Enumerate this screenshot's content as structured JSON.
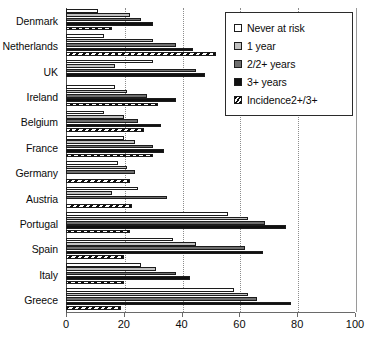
{
  "chart_data": {
    "type": "bar",
    "orientation": "horizontal",
    "title": "",
    "xlabel": "",
    "ylabel": "",
    "xlim": [
      0,
      100
    ],
    "xticks": [
      0,
      20,
      40,
      60,
      80,
      100
    ],
    "grid": true,
    "legend_position": "top-right",
    "categories": [
      "Denmark",
      "Netherlands",
      "UK",
      "Ireland",
      "Belgium",
      "France",
      "Germany",
      "Austria",
      "Portugal",
      "Spain",
      "Italy",
      "Greece"
    ],
    "series": [
      {
        "name": "Never at risk",
        "color": "#ffffff",
        "values": [
          11,
          13,
          30,
          17,
          13,
          20,
          18,
          25,
          56,
          37,
          26,
          58
        ]
      },
      {
        "name": "1 year",
        "color": "#c0c0c0",
        "values": [
          22,
          30,
          17,
          21,
          20,
          24,
          21,
          16,
          63,
          45,
          31,
          63
        ]
      },
      {
        "name": "2/2+ years",
        "color": "#6e6e6e",
        "values": [
          26,
          38,
          45,
          28,
          25,
          30,
          24,
          35,
          69,
          62,
          38,
          66
        ]
      },
      {
        "name": "3+ years",
        "color": "#101010",
        "values": [
          30,
          44,
          48,
          38,
          33,
          34,
          0,
          0,
          76,
          68,
          43,
          78
        ]
      },
      {
        "name": "Incidence2+/3+",
        "color": "#hatch",
        "values": [
          16,
          52,
          0,
          32,
          27,
          30,
          22,
          23,
          22,
          20,
          20,
          19
        ]
      }
    ]
  },
  "legend": {
    "items": [
      {
        "label": "Never at risk"
      },
      {
        "label": "1 year"
      },
      {
        "label": "2/2+ years"
      },
      {
        "label": "3+ years"
      },
      {
        "label": "Incidence2+/3+"
      }
    ]
  },
  "axis": {
    "x_tick_labels": [
      "0",
      "20",
      "40",
      "60",
      "80",
      "100"
    ]
  }
}
